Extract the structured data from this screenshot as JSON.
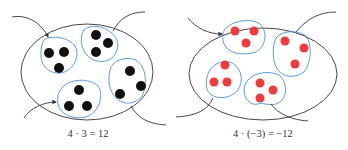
{
  "diagrams": [
    {
      "name": "positive-product",
      "caption": "4 · 3 = 12",
      "group_count": 4,
      "items_per_group": 3,
      "dot_color": "#111111"
    },
    {
      "name": "negative-product",
      "caption": "4 · (−3) = −12",
      "group_count": 4,
      "items_per_group": 3,
      "dot_color": "#ee3b3b"
    }
  ],
  "colors": {
    "ellipse": "#333333",
    "group_outline": "#4a90d9",
    "arrow": "#333333"
  }
}
